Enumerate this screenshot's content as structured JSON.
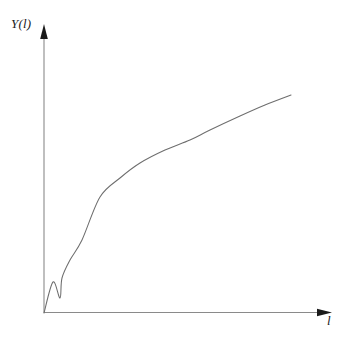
{
  "figure": {
    "width": 346,
    "height": 338,
    "background_color": "#ffffff",
    "axis_color": "#8a8a8a",
    "arrow_color": "#1a1a1a",
    "curve_color": "#6e6e6e"
  },
  "labels": {
    "y_axis": "Y(l)",
    "x_axis": "l"
  },
  "icons": {
    "y_arrow": "up-arrowhead-icon",
    "x_arrow": "right-arrowhead-icon"
  },
  "chart_data": {
    "type": "line",
    "title": "",
    "subtitle": "",
    "xlabel": "l",
    "ylabel": "Y(l)",
    "legend": [],
    "legend_position": "none",
    "grid": false,
    "xlim": [
      0,
      1
    ],
    "ylim": [
      0,
      1
    ],
    "x_tick_labels": [],
    "y_tick_labels": [],
    "annotations": [],
    "series": [
      {
        "name": "Y(l)",
        "x": [
          0.0,
          0.035,
          0.065,
          0.1,
          0.154,
          0.227,
          0.29,
          0.388,
          0.518,
          0.592,
          0.68,
          0.789,
          0.877,
          1.0
        ],
        "y": [
          0.0,
          0.107,
          0.193,
          0.298,
          0.401,
          0.503,
          0.565,
          0.652,
          0.744,
          0.79,
          0.836,
          0.886,
          0.92,
          0.97
        ],
        "points_px": [
          [
            44,
            313
          ],
          [
            53,
            282
          ],
          [
            60,
            298
          ],
          [
            62,
            278
          ],
          [
            70,
            260
          ],
          [
            82,
            240
          ],
          [
            100,
            197
          ],
          [
            120,
            178
          ],
          [
            140,
            163
          ],
          [
            165,
            150
          ],
          [
            190,
            140
          ],
          [
            210,
            130
          ],
          [
            240,
            116
          ],
          [
            265,
            105
          ],
          [
            291,
            95
          ]
        ]
      }
    ],
    "axes_px": {
      "origin": [
        44,
        313
      ],
      "y_axis_top": [
        44,
        24
      ],
      "x_axis_right": [
        332,
        312
      ]
    }
  }
}
